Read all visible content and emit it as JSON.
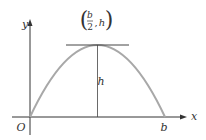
{
  "diagram": {
    "axes": {
      "x_label": "x",
      "y_label": "y",
      "origin_label": "O"
    },
    "curve": {
      "type": "parabola",
      "color": "#a8a8a8"
    },
    "vertex_label": {
      "numerator": "b",
      "denominator": "2",
      "second": "h",
      "open": "(",
      "close": ")",
      "comma": ","
    },
    "height_label": "h",
    "x_intercept_label": "b",
    "colors": {
      "axis": "#333333",
      "curve": "#a8a8a8",
      "line": "#444444"
    }
  }
}
